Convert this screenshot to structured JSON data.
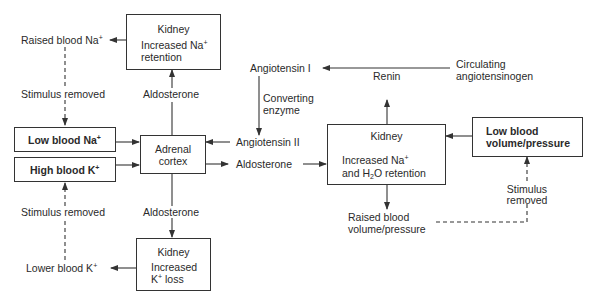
{
  "diagram": {
    "type": "flowchart",
    "title": "",
    "nodes": {
      "kidney_top": {
        "title": "Kidney",
        "line1": "Increased Na",
        "line1_sup": "+",
        "line2": "retention"
      },
      "raised_na": {
        "label": "Raised blood Na",
        "sup": "+"
      },
      "stimulus_removed_na": {
        "label": "Stimulus removed"
      },
      "low_na": {
        "label": "Low blood Na",
        "sup": "+"
      },
      "high_k": {
        "label": "High blood K",
        "sup": "+"
      },
      "stimulus_removed_k": {
        "label": "Stimulus removed"
      },
      "lower_k": {
        "label": "Lower blood K",
        "sup": "+"
      },
      "adrenal": {
        "line1": "Adrenal",
        "line2": "cortex"
      },
      "aldo_up": {
        "label": "Aldosterone"
      },
      "aldo_down": {
        "label": "Aldosterone"
      },
      "aldo_right": {
        "label": "Aldosterone"
      },
      "kidney_bottom": {
        "title": "Kidney",
        "line1": "Increased",
        "line2_pre": "K",
        "line2_sup": "+",
        "line2_post": " loss"
      },
      "angiotensin_1": {
        "label": "Angiotensin I"
      },
      "converting_enzyme": {
        "line1": "Converting",
        "line2": "enzyme"
      },
      "angiotensin_2": {
        "label": "Angiotensin II"
      },
      "renin": {
        "label": "Renin"
      },
      "angiotensinogen": {
        "line1": "Circulating",
        "line2": "angiotensinogen"
      },
      "kidney_right": {
        "title": "Kidney",
        "line1": "Increased Na",
        "line1_sup": "+",
        "line2_pre": "and H",
        "line2_sub": "2",
        "line2_post": "O retention"
      },
      "low_volume": {
        "line1": "Low blood",
        "line2": "volume/pressure"
      },
      "stimulus_removed_vol": {
        "line1": "Stimulus",
        "line2": "removed"
      },
      "raised_volume": {
        "line1": "Raised blood",
        "line2": "volume/pressure"
      }
    },
    "edges": [
      {
        "from": "kidney_top",
        "to": "raised_na",
        "style": "solid"
      },
      {
        "from": "raised_na",
        "to": "low_na",
        "style": "dashed",
        "label": "Stimulus removed"
      },
      {
        "from": "low_na",
        "to": "adrenal",
        "style": "solid"
      },
      {
        "from": "high_k",
        "to": "adrenal",
        "style": "solid"
      },
      {
        "from": "lower_k",
        "to": "high_k",
        "style": "dashed",
        "label": "Stimulus removed"
      },
      {
        "from": "adrenal",
        "to": "kidney_top",
        "style": "solid",
        "label": "Aldosterone"
      },
      {
        "from": "adrenal",
        "to": "kidney_bottom",
        "style": "solid",
        "label": "Aldosterone"
      },
      {
        "from": "kidney_bottom",
        "to": "lower_k",
        "style": "solid"
      },
      {
        "from": "angiotensin_2",
        "to": "adrenal",
        "style": "solid"
      },
      {
        "from": "adrenal",
        "to": "aldo_right",
        "style": "solid"
      },
      {
        "from": "aldo_right",
        "to": "kidney_right",
        "style": "solid"
      },
      {
        "from": "angiotensinogen",
        "to": "angiotensin_1",
        "style": "solid"
      },
      {
        "from": "angiotensin_1",
        "to": "angiotensin_2",
        "style": "solid",
        "label": "Converting enzyme"
      },
      {
        "from": "kidney_right",
        "to": "renin",
        "style": "solid"
      },
      {
        "from": "low_volume",
        "to": "kidney_right",
        "style": "solid"
      },
      {
        "from": "kidney_right",
        "to": "raised_volume",
        "style": "solid"
      },
      {
        "from": "raised_volume",
        "to": "low_volume",
        "style": "dashed",
        "label": "Stimulus removed"
      }
    ]
  }
}
